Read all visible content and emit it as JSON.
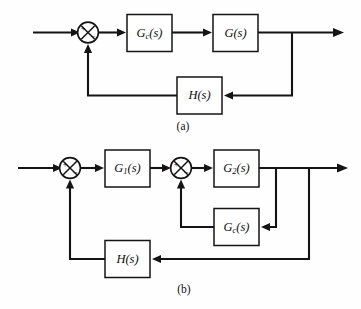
{
  "figure": {
    "type": "control-system-block-diagram",
    "background_color": "#fefefe",
    "line_color": "#141414",
    "panels": [
      {
        "caption": "(a)",
        "blocks": [
          {
            "name": "controller",
            "label_main": "G",
            "label_sub": "c",
            "label_paren": "(s)"
          },
          {
            "name": "plant",
            "label_main": "G",
            "label_sub": "",
            "label_paren": "(s)"
          },
          {
            "name": "feedback-sensor",
            "label_main": "H",
            "label_sub": "",
            "label_paren": "(s)"
          }
        ],
        "summing_junctions": [
          {
            "name": "error-junction",
            "plus": "+",
            "minus": "−"
          }
        ]
      },
      {
        "caption": "(b)",
        "blocks": [
          {
            "name": "block-g1",
            "label_main": "G",
            "label_sub": "1",
            "label_paren": "(s)"
          },
          {
            "name": "block-g2",
            "label_main": "G",
            "label_sub": "2",
            "label_paren": "(s)"
          },
          {
            "name": "inner-controller",
            "label_main": "G",
            "label_sub": "c",
            "label_paren": "(s)"
          },
          {
            "name": "feedback-sensor",
            "label_main": "H",
            "label_sub": "",
            "label_paren": "(s)"
          }
        ],
        "summing_junctions": [
          {
            "name": "outer-error-junction",
            "plus": "+",
            "minus": "−"
          },
          {
            "name": "inner-error-junction",
            "plus": "+",
            "minus": "−"
          }
        ]
      }
    ]
  },
  "labels": {
    "a": {
      "gc_main": "G",
      "gc_sub": "c",
      "gc_paren": "(s)",
      "g_main": "G",
      "g_paren": "(s)",
      "h_main": "H",
      "h_paren": "(s)",
      "sum_plus": "+",
      "sum_minus": "−",
      "caption": "(a)"
    },
    "b": {
      "g1_main": "G",
      "g1_sub": "1",
      "g1_paren": "(s)",
      "g2_main": "G",
      "g2_sub": "2",
      "g2_paren": "(s)",
      "gc_main": "G",
      "gc_sub": "c",
      "gc_paren": "(s)",
      "h_main": "H",
      "h_paren": "(s)",
      "sum1_plus": "+",
      "sum1_minus": "−",
      "sum2_plus": "+",
      "sum2_minus": "−",
      "caption": "(b)"
    }
  }
}
